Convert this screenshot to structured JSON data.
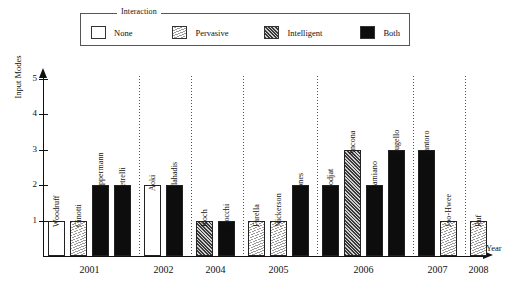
{
  "chart_data": {
    "type": "bar",
    "title": "",
    "xlabel": "Year",
    "ylabel": "Input Modes",
    "ylim": [
      0,
      5
    ],
    "yticks": [
      1,
      2,
      3,
      4,
      5
    ],
    "grid": false,
    "legend": {
      "title": "Interaction",
      "position": "top",
      "entries": [
        {
          "label": "None",
          "fill": "none",
          "color": "#ffffff"
        },
        {
          "label": "Pervasive",
          "fill": "pervasive",
          "color": "#d9d9d9"
        },
        {
          "label": "Intelligent",
          "fill": "intelligent",
          "color": "#6f6f6f"
        },
        {
          "label": "Both",
          "fill": "both",
          "color": "#0d0d0d"
        }
      ]
    },
    "groups": [
      {
        "year": "2001",
        "bars": [
          {
            "label": "Woodruff",
            "value": 1,
            "category": "none"
          },
          {
            "label": "Cinotti",
            "value": 1,
            "category": "pervasive"
          },
          {
            "label": "Oppermann",
            "value": 2,
            "category": "both"
          },
          {
            "label": "Petrelli",
            "value": 2,
            "category": "both"
          }
        ]
      },
      {
        "year": "2002",
        "bars": [
          {
            "label": "Aoki",
            "value": 2,
            "category": "none"
          },
          {
            "label": "Vlahadis",
            "value": 2,
            "category": "both"
          }
        ]
      },
      {
        "year": "2004",
        "bars": [
          {
            "label": "Koch",
            "value": 1,
            "category": "intelligent"
          },
          {
            "label": "Rocchi",
            "value": 1,
            "category": "both"
          }
        ]
      },
      {
        "year": "2005",
        "bars": [
          {
            "label": "Farella",
            "value": 1,
            "category": "pervasive"
          },
          {
            "label": "Nickerson",
            "value": 1,
            "category": "pervasive"
          },
          {
            "label": "Jones",
            "value": 2,
            "category": "both"
          }
        ]
      },
      {
        "year": "2006",
        "bars": [
          {
            "label": "Hodjat",
            "value": 2,
            "category": "both"
          },
          {
            "label": "Ancona",
            "value": 3,
            "category": "intelligent"
          },
          {
            "label": "Damiano",
            "value": 2,
            "category": "both"
          },
          {
            "label": "Augello",
            "value": 3,
            "category": "both"
          }
        ]
      },
      {
        "year": "2007",
        "bars": [
          {
            "label": "Santoro",
            "value": 3,
            "category": "both"
          },
          {
            "label": "Joo-Hwee",
            "value": 1,
            "category": "pervasive"
          }
        ]
      },
      {
        "year": "2008",
        "bars": [
          {
            "label": "Ruf",
            "value": 1,
            "category": "pervasive"
          }
        ]
      }
    ]
  }
}
